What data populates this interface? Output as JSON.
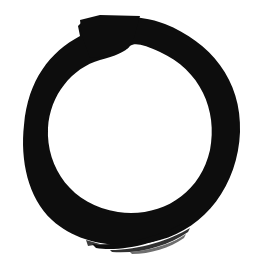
{
  "image": {
    "subject": "enso-brush-circle",
    "background_color": "#ffffff",
    "ink_color": "#0d0d0d",
    "width": 258,
    "height": 276
  }
}
